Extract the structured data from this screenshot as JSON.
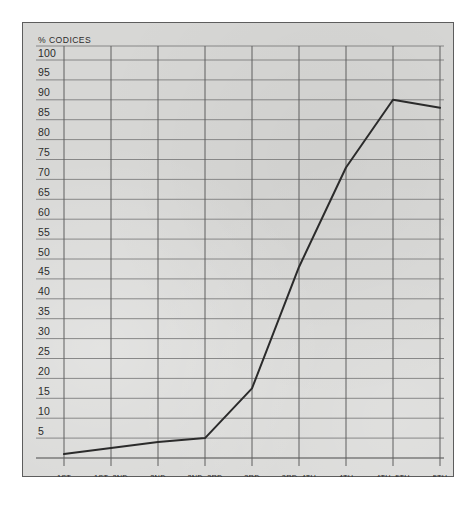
{
  "figure": {
    "panel_color": "#d7d7d5",
    "border_color": "#5d5d5d",
    "line_color": "#2b2b2b",
    "grid_color": "#7e7e7e"
  },
  "chart_data": {
    "type": "line",
    "title": "",
    "xlabel": "",
    "ylabel": "% Codices",
    "ylabel_display": "% CODICES",
    "ylim": [
      0,
      100
    ],
    "grid": true,
    "legend": "none",
    "categories": [
      "1st Century",
      "1st–2nd Century",
      "2nd Century",
      "2nd–3rd Century",
      "3rd Century",
      "3rd–4th Century",
      "4th Century",
      "4th–5th Century",
      "5th Century"
    ],
    "category_lines": [
      [
        "1st",
        "Century"
      ],
      [
        "1st–2nd",
        "Century"
      ],
      [
        "2nd",
        "Century"
      ],
      [
        "2nd–3rd",
        "Century"
      ],
      [
        "3rd",
        "Century"
      ],
      [
        "3rd–4th",
        "Century"
      ],
      [
        "4th",
        "Century"
      ],
      [
        "4th–5th",
        "Century"
      ],
      [
        "5th",
        "Century"
      ]
    ],
    "values": [
      1,
      2.5,
      4,
      5,
      17.5,
      48,
      73,
      90,
      88
    ],
    "yticks": [
      100,
      95,
      90,
      85,
      80,
      75,
      70,
      65,
      60,
      55,
      50,
      45,
      40,
      35,
      30,
      25,
      20,
      15,
      10,
      5
    ],
    "ytick_labels": [
      "100",
      "95",
      "90",
      "85",
      "80",
      "75",
      "70",
      "65",
      "60",
      "55",
      "50",
      "45",
      "40",
      "35",
      "30",
      "25",
      "20",
      "15",
      "10",
      "5"
    ]
  }
}
